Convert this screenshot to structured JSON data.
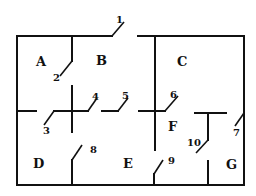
{
  "diagram": {
    "type": "floor-plan",
    "rooms": [
      {
        "id": "A",
        "label": "A",
        "x": 42,
        "y": 66
      },
      {
        "id": "B",
        "label": "B",
        "x": 101,
        "y": 65
      },
      {
        "id": "C",
        "label": "C",
        "x": 183,
        "y": 66
      },
      {
        "id": "D",
        "label": "D",
        "x": 38,
        "y": 167
      },
      {
        "id": "E",
        "label": "E",
        "x": 128,
        "y": 167
      },
      {
        "id": "F",
        "label": "F",
        "x": 172,
        "y": 131
      },
      {
        "id": "G",
        "label": "G",
        "x": 232,
        "y": 168
      }
    ],
    "doors": [
      {
        "id": "1",
        "label": "1",
        "x": 120,
        "y": 22
      },
      {
        "id": "2",
        "label": "2",
        "x": 56,
        "y": 80
      },
      {
        "id": "3",
        "label": "3",
        "x": 47,
        "y": 134
      },
      {
        "id": "4",
        "label": "4",
        "x": 96,
        "y": 99
      },
      {
        "id": "5",
        "label": "5",
        "x": 126,
        "y": 99
      },
      {
        "id": "6",
        "label": "6",
        "x": 174,
        "y": 98
      },
      {
        "id": "7",
        "label": "7",
        "x": 237,
        "y": 135
      },
      {
        "id": "8",
        "label": "8",
        "x": 93,
        "y": 152
      },
      {
        "id": "9",
        "label": "9",
        "x": 170,
        "y": 164
      },
      {
        "id": "10",
        "label": "10",
        "x": 189,
        "y": 145
      }
    ],
    "colors": {
      "ink": "#111111",
      "background": "#ffffff"
    }
  }
}
